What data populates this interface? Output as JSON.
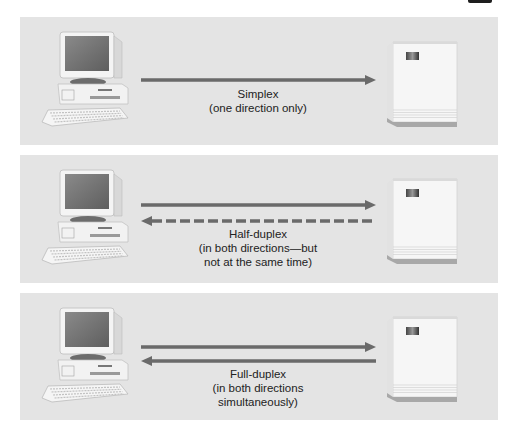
{
  "figure": {
    "colors": {
      "panel_bg": "#e4e4e4",
      "arrow": "#6a6a6a",
      "text": "#222222"
    },
    "panels": [
      {
        "id": "simplex",
        "mode": "Simplex",
        "description_lines": [
          "(one direction only)"
        ],
        "arrows": [
          {
            "direction": "right",
            "style": "solid"
          }
        ],
        "left_device": "computer",
        "right_device": "server"
      },
      {
        "id": "half-duplex",
        "mode": "Half-duplex",
        "description_lines": [
          "(in both directions—but",
          "not at the same time)"
        ],
        "arrows": [
          {
            "direction": "right",
            "style": "solid"
          },
          {
            "direction": "left",
            "style": "dashed"
          }
        ],
        "left_device": "computer",
        "right_device": "server"
      },
      {
        "id": "full-duplex",
        "mode": "Full-duplex",
        "description_lines": [
          "(in both directions",
          "simultaneously)"
        ],
        "arrows": [
          {
            "direction": "right",
            "style": "solid"
          },
          {
            "direction": "left",
            "style": "solid"
          }
        ],
        "left_device": "computer",
        "right_device": "server"
      }
    ]
  }
}
